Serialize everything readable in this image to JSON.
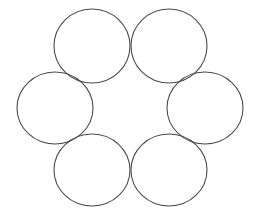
{
  "diagram": {
    "width": 257,
    "height": 215,
    "background": "#ffffff",
    "stroke_color": "#4a4a4a",
    "shapes": [
      {
        "name": "circle-top-left",
        "cx": 92,
        "cy": 46,
        "rx": 38,
        "ry": 37
      },
      {
        "name": "circle-top-right",
        "cx": 169,
        "cy": 46,
        "rx": 38,
        "ry": 37
      },
      {
        "name": "circle-middle-left",
        "cx": 55,
        "cy": 108,
        "rx": 38,
        "ry": 36
      },
      {
        "name": "circle-middle-right",
        "cx": 205,
        "cy": 108,
        "rx": 38,
        "ry": 36
      },
      {
        "name": "circle-bottom-left",
        "cx": 92,
        "cy": 170,
        "rx": 38,
        "ry": 36
      },
      {
        "name": "circle-bottom-right",
        "cx": 169,
        "cy": 170,
        "rx": 38,
        "ry": 36
      }
    ]
  }
}
